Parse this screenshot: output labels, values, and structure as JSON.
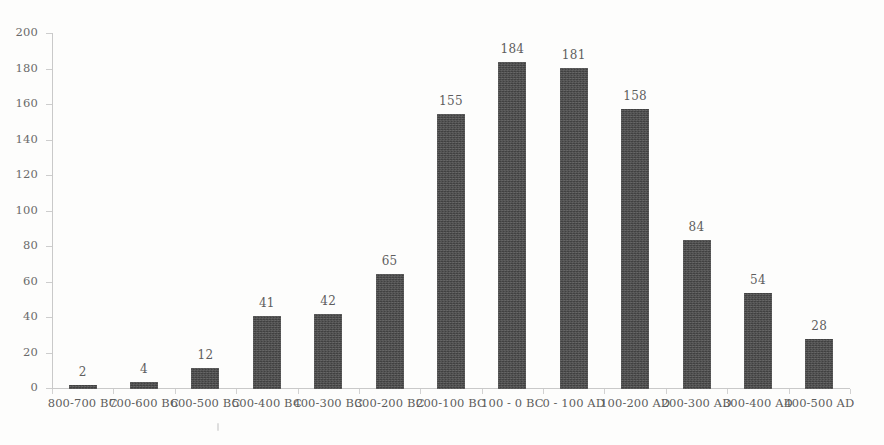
{
  "chart_data": {
    "type": "bar",
    "title": "",
    "subtitle": "",
    "xlabel": "",
    "ylabel": "",
    "ylim": [
      0,
      200
    ],
    "ytick_step": 20,
    "yticks": [
      0,
      20,
      40,
      60,
      80,
      100,
      120,
      140,
      160,
      180,
      200
    ],
    "grid": false,
    "legend": null,
    "legend_position": "none",
    "bar_color": "#414141",
    "axis_color": "#c9c9c9",
    "label_color": "#5e5e5e",
    "background_color": "#fdfdfc",
    "data_labels_shown": true,
    "categories": [
      "800-700 BC",
      "700-600 BC",
      "600-500 BC",
      "500-400 BC",
      "400-300 BC",
      "300-200 BC",
      "200-100 BC",
      "100 - 0 BC",
      "0 - 100 AD",
      "100-200 AD",
      "200-300 AD",
      "300-400 AD",
      "400-500 AD"
    ],
    "values": [
      2,
      4,
      12,
      41,
      42,
      65,
      155,
      184,
      181,
      158,
      84,
      54,
      28
    ]
  }
}
